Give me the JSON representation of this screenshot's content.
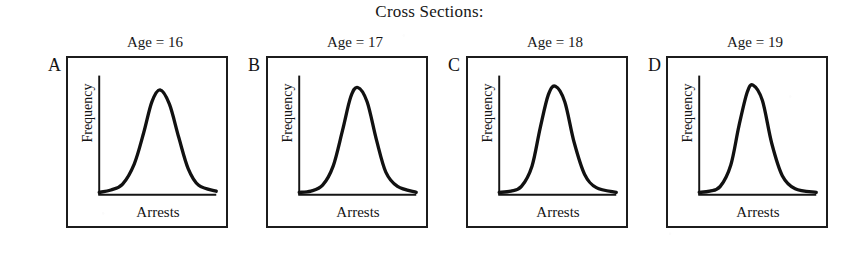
{
  "figure": {
    "title": "Cross Sections:"
  },
  "panels": [
    {
      "letter": "A",
      "age_label": "Age = 16",
      "x_axis_label": "Arrests",
      "y_axis_label": "Frequency"
    },
    {
      "letter": "B",
      "age_label": "Age = 17",
      "x_axis_label": "Arrests",
      "y_axis_label": "Frequency"
    },
    {
      "letter": "C",
      "age_label": "Age = 18",
      "x_axis_label": "Arrests",
      "y_axis_label": "Frequency"
    },
    {
      "letter": "D",
      "age_label": "Age = 19",
      "x_axis_label": "Arrests",
      "y_axis_label": "Frequency"
    }
  ],
  "chart_data": {
    "type": "line",
    "title": "Cross Sections:",
    "xlabel": "Arrests",
    "ylabel": "Frequency",
    "grid": false,
    "legend": "none",
    "axis_ticks": false,
    "xlim": [
      0,
      1
    ],
    "ylim": [
      0,
      1
    ],
    "series": [
      {
        "name": "Age = 16",
        "panel": "A",
        "peak_x": 0.52,
        "peak_y": 0.88,
        "spread": 0.155,
        "x": [
          0.0,
          0.1,
          0.2,
          0.3,
          0.38,
          0.45,
          0.52,
          0.6,
          0.68,
          0.76,
          0.85,
          1.0
        ],
        "values": [
          0.02,
          0.04,
          0.09,
          0.26,
          0.52,
          0.78,
          0.88,
          0.76,
          0.48,
          0.22,
          0.08,
          0.03
        ]
      },
      {
        "name": "Age = 17",
        "panel": "B",
        "peak_x": 0.5,
        "peak_y": 0.9,
        "spread": 0.14,
        "x": [
          0.0,
          0.1,
          0.2,
          0.29,
          0.37,
          0.44,
          0.5,
          0.58,
          0.66,
          0.74,
          0.84,
          1.0
        ],
        "values": [
          0.02,
          0.03,
          0.08,
          0.24,
          0.54,
          0.82,
          0.9,
          0.78,
          0.46,
          0.19,
          0.07,
          0.02
        ]
      },
      {
        "name": "Age = 18",
        "panel": "C",
        "peak_x": 0.48,
        "peak_y": 0.91,
        "spread": 0.13,
        "x": [
          0.0,
          0.1,
          0.19,
          0.28,
          0.35,
          0.42,
          0.48,
          0.56,
          0.64,
          0.73,
          0.83,
          1.0
        ],
        "values": [
          0.02,
          0.03,
          0.07,
          0.24,
          0.56,
          0.84,
          0.91,
          0.78,
          0.44,
          0.17,
          0.06,
          0.02
        ]
      },
      {
        "name": "Age = 19",
        "panel": "D",
        "peak_x": 0.46,
        "peak_y": 0.92,
        "spread": 0.125,
        "x": [
          0.0,
          0.09,
          0.18,
          0.27,
          0.34,
          0.41,
          0.46,
          0.54,
          0.62,
          0.71,
          0.82,
          1.0
        ],
        "values": [
          0.02,
          0.03,
          0.07,
          0.25,
          0.58,
          0.86,
          0.92,
          0.79,
          0.43,
          0.16,
          0.05,
          0.02
        ]
      }
    ]
  }
}
